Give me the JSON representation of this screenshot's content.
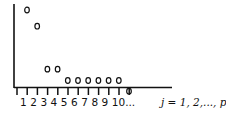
{
  "chart_data": {
    "type": "scatter",
    "title": "",
    "xlabel": "j = 1, 2,..., p",
    "ylabel": "",
    "x": [
      1,
      2,
      3,
      4,
      5,
      6,
      7,
      8,
      9,
      10,
      11
    ],
    "values": [
      9.5,
      7.5,
      2.2,
      2.2,
      0.8,
      0.8,
      0.8,
      0.8,
      0.8,
      0.8,
      0.1
    ],
    "tick_labels": [
      "1",
      "2",
      "3",
      "4",
      "5",
      "6",
      "7",
      "8",
      "9",
      "10..."
    ],
    "grid": false,
    "legend": null,
    "marker": "open-circle"
  },
  "axis": {
    "x_label": "j = 1, 2,..., p",
    "tick_label_text": "1 2 3 4 5 6 7 8 9 10..."
  }
}
